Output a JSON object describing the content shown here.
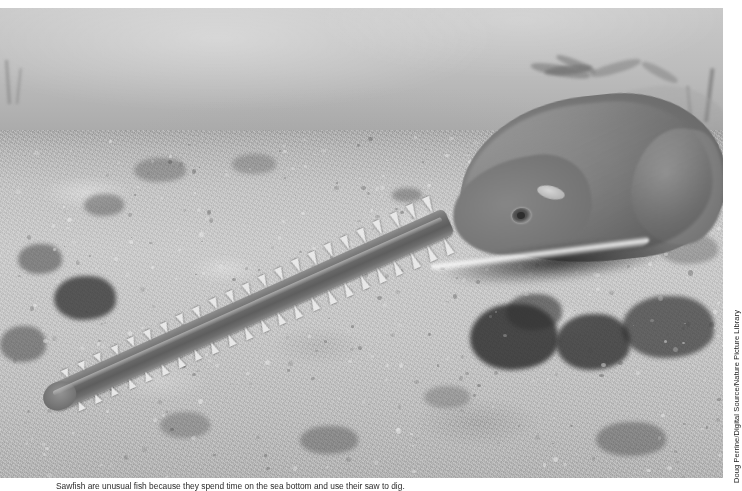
{
  "page": {
    "background_color": "#ffffff",
    "width": 742,
    "height": 491
  },
  "photo": {
    "alt_description": "Underwater black-and-white photograph of a sawfish resting on a sandy seafloor, its long toothed rostrum extending diagonally across the frame",
    "subject": "sawfish",
    "scene": "sandy seafloor with dark algae clumps and hazy open water above",
    "palette": {
      "water": "#c3c3c3",
      "sand": "#c0c0c0",
      "fish_body": "#7c7c7c",
      "rostrum": "#6a6a6a",
      "teeth": "#e8e8e8",
      "algae": "#3a3a3a"
    },
    "rostrum": {
      "teeth_count_upper": 23,
      "teeth_count_lower": 23
    }
  },
  "credit": {
    "text": "Doug Perrine/Digital Source/Nature Picture Library",
    "orientation": "vertical",
    "position": "right-margin"
  },
  "caption": {
    "text": "Sawfish are unusual fish because they spend time on the sea bottom and use their saw to dig.",
    "note": "clipped by page bottom edge"
  }
}
